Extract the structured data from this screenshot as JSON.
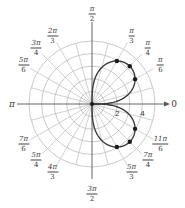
{
  "figure": {
    "type": "polar-plot",
    "curve_description": "lemniscate-like two-petal curve in quadrants I and IV",
    "center": [
      92,
      104
    ],
    "ring_spacing_px": 12.6,
    "ring_count": 5,
    "radial_labels": [
      {
        "text": "2",
        "r": 2
      },
      {
        "text": "4",
        "r": 4
      }
    ],
    "axis_labels": {
      "zero": "0",
      "pi": "π"
    },
    "angle_labels": [
      {
        "id": "pi-2",
        "num": "π",
        "den": "2",
        "deg": 90
      },
      {
        "id": "pi-3",
        "num": "π",
        "den": "3",
        "deg": 60
      },
      {
        "id": "pi-4",
        "num": "π",
        "den": "4",
        "deg": 45
      },
      {
        "id": "pi-6",
        "num": "π",
        "den": "6",
        "deg": 30
      },
      {
        "id": "2pi-3",
        "num": "2π",
        "den": "3",
        "deg": 120
      },
      {
        "id": "3pi-4",
        "num": "3π",
        "den": "4",
        "deg": 135
      },
      {
        "id": "5pi-6",
        "num": "5π",
        "den": "6",
        "deg": 150
      },
      {
        "id": "7pi-6",
        "num": "7π",
        "den": "6",
        "deg": 210
      },
      {
        "id": "5pi-4",
        "num": "5π",
        "den": "4",
        "deg": 225
      },
      {
        "id": "4pi-3",
        "num": "4π",
        "den": "3",
        "deg": 240
      },
      {
        "id": "3pi-2",
        "num": "3π",
        "den": "2",
        "deg": 270
      },
      {
        "id": "5pi-3",
        "num": "5π",
        "den": "3",
        "deg": 300
      },
      {
        "id": "7pi-4",
        "num": "7π",
        "den": "4",
        "deg": 315
      },
      {
        "id": "11pi-6",
        "num": "11π",
        "den": "6",
        "deg": 330
      }
    ],
    "marked_points_deg": [
      30,
      45,
      60,
      300,
      315,
      330
    ],
    "curve_r_max": 4.24,
    "colors": {
      "grid": "#bdbdbd",
      "axis": "#555555",
      "curve": "#3a3a3a",
      "points": "#1a1a1a"
    }
  }
}
